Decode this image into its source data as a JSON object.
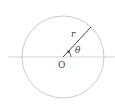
{
  "diagram": {
    "type": "polar-coordinates",
    "labels": {
      "radius": "r",
      "angle": "θ",
      "origin": "O"
    },
    "colors": {
      "circle": "#bdbdbd",
      "axis": "#c8c8c8",
      "radius_line": "#333333",
      "text": "#444444"
    }
  }
}
